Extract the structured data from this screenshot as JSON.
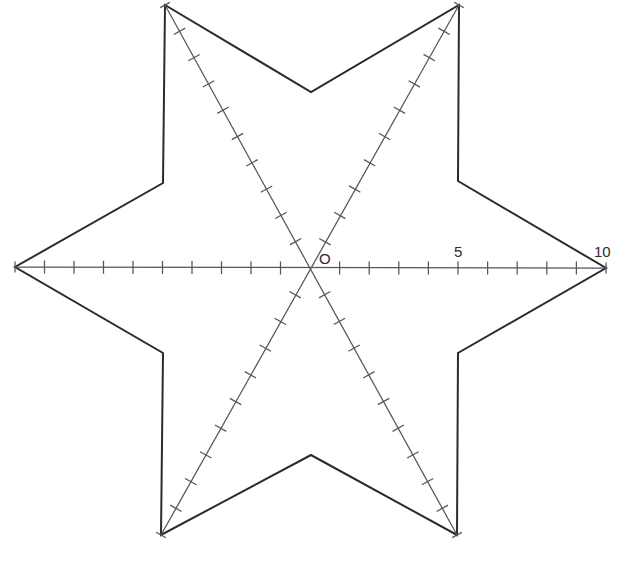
{
  "figure": {
    "background_color": "#ffffff",
    "outline_color": "#2b2b2b",
    "axis_color": "#55555a",
    "label_color": "#2b2b2b",
    "width": 630,
    "height": 587
  },
  "chart_data": {
    "type": "line",
    "title": "",
    "xlabel": "",
    "ylabel": "",
    "grid": false,
    "legend": null,
    "center": {
      "x": 310,
      "y": 268,
      "label": "O",
      "value": 0
    },
    "axis_range": [
      0,
      10
    ],
    "major_tick_interval": 5,
    "minor_tick_interval": 1,
    "tick_count_per_arm": 10,
    "tick_labels_visible": [
      "O",
      "5",
      "10"
    ],
    "axes": [
      {
        "name": "horizontal-axis",
        "angle_deg": 0,
        "arms": [
          {
            "name": "left-arm",
            "tip": {
              "x": 15,
              "y": 267
            },
            "ticks": 10,
            "labeled": []
          },
          {
            "name": "right-arm",
            "tip": {
              "x": 606,
              "y": 268
            },
            "ticks": 10,
            "labeled": [
              5,
              10
            ]
          }
        ]
      },
      {
        "name": "upper-left-to-lower-right-axis",
        "angle_deg": 60,
        "arms": [
          {
            "name": "upper-left-arm",
            "tip": {
              "x": 165,
              "y": 5
            },
            "ticks": 10,
            "labeled": []
          },
          {
            "name": "lower-right-arm",
            "tip": {
              "x": 457,
              "y": 535
            },
            "ticks": 10,
            "labeled": []
          }
        ]
      },
      {
        "name": "upper-right-to-lower-left-axis",
        "angle_deg": 120,
        "arms": [
          {
            "name": "upper-right-arm",
            "tip": {
              "x": 459,
              "y": 5
            },
            "ticks": 10,
            "labeled": []
          },
          {
            "name": "lower-left-arm",
            "tip": {
              "x": 161,
              "y": 535
            },
            "ticks": 10,
            "labeled": []
          }
        ]
      }
    ],
    "star_points": 6,
    "star_outline_vertices": [
      {
        "kind": "tip",
        "name": "upper-left-tip",
        "x": 165,
        "y": 5
      },
      {
        "kind": "inner",
        "name": "top-center-inner",
        "x": 311,
        "y": 92
      },
      {
        "kind": "tip",
        "name": "upper-right-tip",
        "x": 459,
        "y": 5
      },
      {
        "kind": "inner",
        "name": "upper-right-inner",
        "x": 458,
        "y": 181
      },
      {
        "kind": "tip",
        "name": "right-tip",
        "x": 606,
        "y": 268
      },
      {
        "kind": "inner",
        "name": "lower-right-inner",
        "x": 458,
        "y": 353
      },
      {
        "kind": "tip",
        "name": "lower-right-tip",
        "x": 457,
        "y": 535
      },
      {
        "kind": "inner",
        "name": "bottom-center-inner",
        "x": 311,
        "y": 455
      },
      {
        "kind": "tip",
        "name": "lower-left-tip",
        "x": 161,
        "y": 535
      },
      {
        "kind": "inner",
        "name": "lower-left-inner",
        "x": 163,
        "y": 353
      },
      {
        "kind": "tip",
        "name": "left-tip",
        "x": 15,
        "y": 267
      },
      {
        "kind": "inner",
        "name": "upper-left-inner",
        "x": 163,
        "y": 183
      }
    ]
  },
  "labels": {
    "origin": "O",
    "mid": "5",
    "end": "10"
  },
  "label_positions": {
    "origin": {
      "x": 319,
      "y": 264
    },
    "mid": {
      "x": 454,
      "y": 257
    },
    "end": {
      "x": 594,
      "y": 257
    }
  }
}
